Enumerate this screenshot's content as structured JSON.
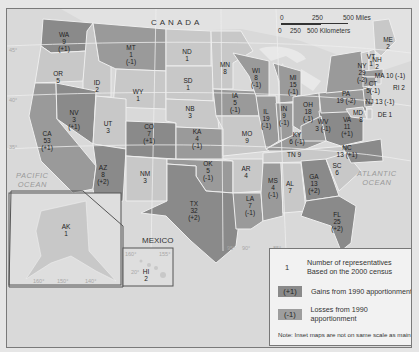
{
  "map": {
    "title_labels": {
      "canada": "CANADA",
      "mexico": "MEXICO",
      "pacific_ocean": [
        "PACIFIC",
        "OCEAN"
      ],
      "atlantic_ocean": [
        "ATLANTIC",
        "OCEAN"
      ]
    },
    "scale": {
      "miles_ticks": [
        "0",
        "250",
        "500 Miles"
      ],
      "km_ticks": [
        "0",
        "250",
        "500 Kilometers"
      ]
    },
    "colors": {
      "gain": "#8a8a8a",
      "loss": "#9e9e9e",
      "unchanged": "#c8c8c8",
      "water": "#dcdcdc",
      "legend_bg": "#f2f2f2"
    },
    "states": [
      {
        "abbr": "WA",
        "reps": "9",
        "change": "(+1)"
      },
      {
        "abbr": "OR",
        "reps": "5",
        "change": ""
      },
      {
        "abbr": "CA",
        "reps": "53",
        "change": "(+1)"
      },
      {
        "abbr": "ID",
        "reps": "2",
        "change": ""
      },
      {
        "abbr": "NV",
        "reps": "3",
        "change": "(+1)"
      },
      {
        "abbr": "MT",
        "reps": "1",
        "change": "(-1)"
      },
      {
        "abbr": "WY",
        "reps": "1",
        "change": ""
      },
      {
        "abbr": "UT",
        "reps": "3",
        "change": ""
      },
      {
        "abbr": "AZ",
        "reps": "8",
        "change": "(+2)"
      },
      {
        "abbr": "CO",
        "reps": "7",
        "change": "(+1)"
      },
      {
        "abbr": "NM",
        "reps": "3",
        "change": ""
      },
      {
        "abbr": "ND",
        "reps": "1",
        "change": ""
      },
      {
        "abbr": "SD",
        "reps": "1",
        "change": ""
      },
      {
        "abbr": "NB",
        "reps": "3",
        "change": ""
      },
      {
        "abbr": "KA",
        "reps": "4",
        "change": "(-1)"
      },
      {
        "abbr": "OK",
        "reps": "5",
        "change": "(-1)"
      },
      {
        "abbr": "TX",
        "reps": "32",
        "change": "(+2)"
      },
      {
        "abbr": "MN",
        "reps": "8",
        "change": ""
      },
      {
        "abbr": "IA",
        "reps": "5",
        "change": "(-1)"
      },
      {
        "abbr": "MO",
        "reps": "9",
        "change": ""
      },
      {
        "abbr": "AR",
        "reps": "4",
        "change": ""
      },
      {
        "abbr": "LA",
        "reps": "7",
        "change": "(-1)"
      },
      {
        "abbr": "WI",
        "reps": "8",
        "change": "(-1)"
      },
      {
        "abbr": "IL",
        "reps": "19",
        "change": "(-1)"
      },
      {
        "abbr": "MI",
        "reps": "15",
        "change": "(-1)"
      },
      {
        "abbr": "IN",
        "reps": "9",
        "change": "(-1)"
      },
      {
        "abbr": "OH",
        "reps": "18",
        "change": "(-1)"
      },
      {
        "abbr": "KY",
        "reps": "6",
        "change": "(-1)"
      },
      {
        "abbr": "TN",
        "reps": "9",
        "change": ""
      },
      {
        "abbr": "MS",
        "reps": "4",
        "change": "(-1)"
      },
      {
        "abbr": "AL",
        "reps": "7",
        "change": ""
      },
      {
        "abbr": "GA",
        "reps": "13",
        "change": "(+2)"
      },
      {
        "abbr": "FL",
        "reps": "25",
        "change": "(+2)"
      },
      {
        "abbr": "SC",
        "reps": "6",
        "change": ""
      },
      {
        "abbr": "NC",
        "reps": "13",
        "change": "(+1)"
      },
      {
        "abbr": "VA",
        "reps": "11",
        "change": "(+1)"
      },
      {
        "abbr": "WV",
        "reps": "3",
        "change": "(-1)"
      },
      {
        "abbr": "PA",
        "reps": "19",
        "change": "(-2)"
      },
      {
        "abbr": "NY",
        "reps": "29",
        "change": "(-2)"
      },
      {
        "abbr": "VT",
        "reps": "1",
        "change": ""
      },
      {
        "abbr": "NH",
        "reps": "2",
        "change": ""
      },
      {
        "abbr": "ME",
        "reps": "2",
        "change": ""
      },
      {
        "abbr": "MA",
        "reps": "10",
        "change": "(-1)"
      },
      {
        "abbr": "RI",
        "reps": "2",
        "change": ""
      },
      {
        "abbr": "CT",
        "reps": "5",
        "change": "(-1)"
      },
      {
        "abbr": "NJ",
        "reps": "13",
        "change": "(-1)"
      },
      {
        "abbr": "MD",
        "reps": "8",
        "change": ""
      },
      {
        "abbr": "DE",
        "reps": "1",
        "change": ""
      },
      {
        "abbr": "AK",
        "reps": "1",
        "change": ""
      },
      {
        "abbr": "HI",
        "reps": "2",
        "change": ""
      }
    ],
    "graticule": {
      "lat_left": [
        "45°",
        "40°",
        "35°"
      ],
      "lon_bottom": [
        "95°",
        "90°",
        "85°"
      ],
      "alaska_lon": [
        "160°",
        "150°",
        "140°"
      ],
      "hawaii_lon": [
        "160°",
        "155°"
      ],
      "hawaii_lat": "20°"
    }
  },
  "legend": {
    "number_key": "1",
    "number_line1": "Number of representatives",
    "number_line2": "Based on the 2000 census",
    "gain_key": "(+1)",
    "gain_label": "Gains from 1990 apportionment",
    "loss_key": "(-1)",
    "loss_label": "Losses from 1990 apportionment",
    "note": "Note: Inset maps are not on same scale as main map"
  }
}
